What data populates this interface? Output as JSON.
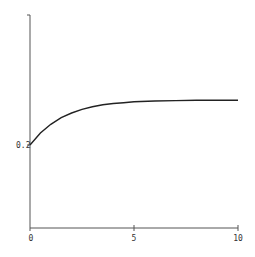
{
  "chart_data": {
    "type": "line",
    "title": "",
    "xlabel": "",
    "ylabel": "",
    "xlim": [
      0,
      10
    ],
    "ylim": [
      0,
      0.5
    ],
    "grid": false,
    "legend": null,
    "x_ticks": [
      "0",
      "5",
      "10"
    ],
    "y_ticks": [
      "0.2"
    ],
    "series": [
      {
        "name": "curve",
        "x": [
          0,
          0.5,
          1,
          1.5,
          2,
          2.5,
          3,
          3.5,
          4,
          4.5,
          5,
          6,
          7,
          8,
          9,
          10
        ],
        "values": [
          0.2,
          0.229,
          0.25,
          0.266,
          0.277,
          0.286,
          0.292,
          0.297,
          0.3,
          0.302,
          0.304,
          0.306,
          0.307,
          0.308,
          0.308,
          0.308
        ]
      }
    ],
    "colors": {
      "axis": "#444444",
      "line": "#222222"
    }
  }
}
